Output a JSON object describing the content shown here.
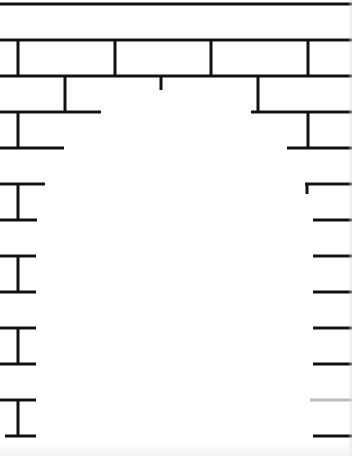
{
  "image": {
    "title": "Brick wall with doorway opening",
    "description": "Line drawing of a brick wall with an arched doorway opening cut into the center",
    "stroke_color": "#111111",
    "faded_stroke_color": "#bdbdbd",
    "background_color": "#ffffff",
    "stroke_width": 3
  },
  "lines": {
    "horizontal": [
      {
        "y": 4,
        "x1": 0,
        "x2": 352
      },
      {
        "y": 40,
        "x1": 0,
        "x2": 352
      },
      {
        "y": 76,
        "x1": 0,
        "x2": 352
      },
      {
        "y": 112,
        "x1": 0,
        "x2": 101
      },
      {
        "y": 112,
        "x1": 251,
        "x2": 352
      },
      {
        "y": 148,
        "x1": 0,
        "x2": 64
      },
      {
        "y": 148,
        "x1": 287,
        "x2": 352
      },
      {
        "y": 184,
        "x1": 0,
        "x2": 45
      },
      {
        "y": 184,
        "x1": 305,
        "x2": 352
      },
      {
        "y": 220,
        "x1": 0,
        "x2": 37
      },
      {
        "y": 220,
        "x1": 313,
        "x2": 352
      },
      {
        "y": 256,
        "x1": 0,
        "x2": 36
      },
      {
        "y": 256,
        "x1": 313,
        "x2": 352
      },
      {
        "y": 292,
        "x1": 0,
        "x2": 36
      },
      {
        "y": 292,
        "x1": 313,
        "x2": 352
      },
      {
        "y": 328,
        "x1": 0,
        "x2": 36
      },
      {
        "y": 328,
        "x1": 313,
        "x2": 352
      },
      {
        "y": 364,
        "x1": 0,
        "x2": 36
      },
      {
        "y": 364,
        "x1": 313,
        "x2": 352
      },
      {
        "y": 400,
        "x1": 0,
        "x2": 36
      },
      {
        "y": 400,
        "x1": 310,
        "x2": 352,
        "faded": true
      },
      {
        "y": 436,
        "x1": 5,
        "x2": 36
      },
      {
        "y": 436,
        "x1": 313,
        "x2": 352
      }
    ],
    "vertical": [
      {
        "x": 18,
        "y1": 40,
        "y2": 76
      },
      {
        "x": 115,
        "y1": 40,
        "y2": 76
      },
      {
        "x": 211,
        "y1": 40,
        "y2": 76
      },
      {
        "x": 308,
        "y1": 40,
        "y2": 76
      },
      {
        "x": 65,
        "y1": 76,
        "y2": 112
      },
      {
        "x": 161,
        "y1": 76,
        "y2": 90
      },
      {
        "x": 258,
        "y1": 76,
        "y2": 112
      },
      {
        "x": 18,
        "y1": 112,
        "y2": 148
      },
      {
        "x": 308,
        "y1": 112,
        "y2": 148
      },
      {
        "x": 18,
        "y1": 184,
        "y2": 220
      },
      {
        "x": 18,
        "y1": 256,
        "y2": 292
      },
      {
        "x": 18,
        "y1": 328,
        "y2": 364
      },
      {
        "x": 18,
        "y1": 400,
        "y2": 436
      }
    ],
    "ticks": [
      {
        "x": 307,
        "y1": 184,
        "y2": 194
      }
    ]
  }
}
